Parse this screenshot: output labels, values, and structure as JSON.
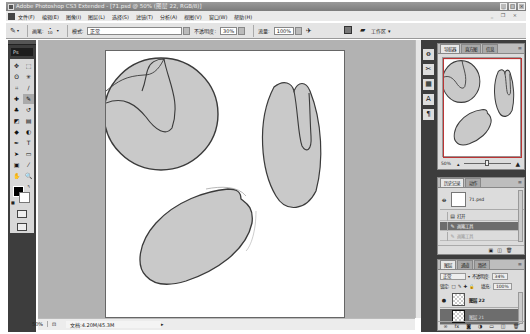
{
  "window": {
    "title": "Adobe Photoshop CS3 Extended - [71.psd @ 50% (图层 22, RGB/8)]",
    "controls": [
      "minimize",
      "maximize",
      "close"
    ],
    "doc_controls": "_ ❐ ×"
  },
  "menu": {
    "items": [
      "文件(F)",
      "编辑(E)",
      "图像(I)",
      "图层(L)",
      "选择(S)",
      "滤镜(T)",
      "分析(A)",
      "视图(V)",
      "窗口(W)",
      "帮助(H)"
    ]
  },
  "options_bar": {
    "tool_icon": "brush-icon",
    "brush_label": "画笔:",
    "brush_size": "10",
    "mode_label": "模式:",
    "mode_value": "正常",
    "opacity_label": "不透明度:",
    "opacity_value": "30%",
    "flow_label": "流量:",
    "flow_value": "100%",
    "workspace_label": "工作区 ▾"
  },
  "tools": {
    "logo": "Ps",
    "items": [
      {
        "name": "move",
        "glyph": "✥"
      },
      {
        "name": "marquee",
        "glyph": "⬚"
      },
      {
        "name": "lasso",
        "glyph": "ʘ"
      },
      {
        "name": "magic-wand",
        "glyph": "✳"
      },
      {
        "name": "crop",
        "glyph": "⌗"
      },
      {
        "name": "slice",
        "glyph": "∕"
      },
      {
        "name": "healing",
        "glyph": "✚"
      },
      {
        "name": "brush",
        "glyph": "✎"
      },
      {
        "name": "clone-stamp",
        "glyph": "♣"
      },
      {
        "name": "history-brush",
        "glyph": "↺"
      },
      {
        "name": "eraser",
        "glyph": "◩"
      },
      {
        "name": "gradient",
        "glyph": "▤"
      },
      {
        "name": "blur",
        "glyph": "◆"
      },
      {
        "name": "dodge",
        "glyph": "◐"
      },
      {
        "name": "pen",
        "glyph": "✒"
      },
      {
        "name": "type",
        "glyph": "T"
      },
      {
        "name": "path-select",
        "glyph": "➤"
      },
      {
        "name": "shape",
        "glyph": "▭"
      },
      {
        "name": "notes",
        "glyph": "▣"
      },
      {
        "name": "eyedropper",
        "glyph": "⁄"
      },
      {
        "name": "hand",
        "glyph": "✋"
      },
      {
        "name": "zoom",
        "glyph": "🔍"
      }
    ],
    "foreground_color": "#000000",
    "background_color": "#ffffff"
  },
  "status_bar": {
    "zoom": "50%",
    "doc_info": "文档:4.20M/45.3M"
  },
  "dock": {
    "icons": [
      "history-brush-icon",
      "tools-preset-icon",
      "layer-comps-icon",
      "character-icon",
      "paragraph-icon"
    ],
    "glyphs": [
      "ꝋ",
      "✂",
      "▦",
      "A",
      "¶"
    ]
  },
  "navigator_panel": {
    "tabs": [
      "导航器",
      "直方图",
      "信息"
    ],
    "zoom_value": "50%"
  },
  "history_panel": {
    "tabs": [
      "历史记录",
      "动作"
    ],
    "snapshot_name": "71.psd",
    "states": [
      {
        "label": "打开",
        "state": "normal"
      },
      {
        "label": "画笔工具",
        "state": "selected"
      },
      {
        "label": "画笔工具",
        "state": "dimmed"
      }
    ]
  },
  "layers_panel": {
    "tabs": [
      "图层",
      "通道",
      "路径"
    ],
    "blend_mode": "正常",
    "opacity_label": "不透明度:",
    "opacity_value": "34%",
    "lock_label": "锁定:",
    "fill_label": "填充:",
    "fill_value": "100%",
    "layers": [
      {
        "name": "图层 22",
        "visible": true,
        "selected": false
      },
      {
        "name": "图层 21",
        "visible": false,
        "selected": true
      }
    ],
    "footer_icons": [
      "link-icon",
      "fx-icon",
      "mask-icon",
      "adjustment-icon",
      "group-icon",
      "new-layer-icon",
      "trash-icon"
    ]
  },
  "canvas": {
    "fill_color": "#c9c9c9",
    "stroke_color": "#3a3a3a"
  }
}
